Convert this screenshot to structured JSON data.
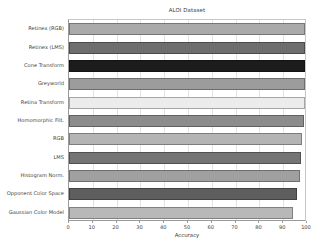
{
  "chart_data": {
    "type": "bar",
    "orientation": "horizontal",
    "title": "ALOI Dataset",
    "xlabel": "Accuracy",
    "ylabel": "",
    "xlim": [
      0,
      100
    ],
    "xticks": [
      0,
      10,
      20,
      30,
      40,
      50,
      60,
      70,
      80,
      90,
      100
    ],
    "xticklabels": [
      "0",
      "10",
      "20",
      "30",
      "40",
      "50",
      "60",
      "70",
      "80",
      "90",
      "100"
    ],
    "grid": true,
    "grid_axis": "x",
    "legend": null,
    "categories": [
      "Retinex (RGB)",
      "Retinex (LMS)",
      "Cone Transform",
      "Greyworld",
      "Retina Transform",
      "Homomorphic Filt.",
      "RGB",
      "LMS",
      "Histogram Norm.",
      "Opponent Color Space",
      "Gaussian Color Model"
    ],
    "values": [
      99.0,
      99.0,
      99.0,
      99.0,
      99.0,
      98.6,
      98.0,
      97.6,
      97.0,
      95.6,
      94.0
    ],
    "bar_colors": [
      "#aaaaaa",
      "#6e6e6e",
      "#1c1c1c",
      "#9c9c9c",
      "#ececec",
      "#8c8c8c",
      "#b4b4b4",
      "#747474",
      "#a0a0a0",
      "#5e5e5e",
      "#b8b8b8"
    ]
  }
}
